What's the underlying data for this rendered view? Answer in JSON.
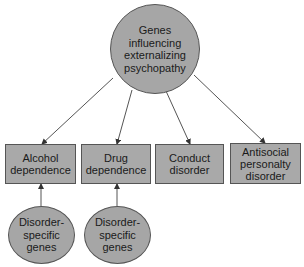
{
  "diagram": {
    "root": {
      "label": "Genes\ninfluencing\nexternalizing\npsychopathy",
      "fill": "#a6a6a6"
    },
    "disorders": [
      {
        "label": "Alcohol\ndependence"
      },
      {
        "label": "Drug\ndependence"
      },
      {
        "label": "Conduct\ndisorder"
      },
      {
        "label": "Antisocial\npersonalty\ndisorder"
      }
    ],
    "specific_genes": [
      {
        "label": "Disorder-\nspecific\ngenes",
        "target": "Alcohol dependence"
      },
      {
        "label": "Disorder-\nspecific\ngenes",
        "target": "Drug dependence"
      }
    ],
    "edges": [
      {
        "from": "Genes influencing externalizing psychopathy",
        "to": "Alcohol dependence"
      },
      {
        "from": "Genes influencing externalizing psychopathy",
        "to": "Drug dependence"
      },
      {
        "from": "Genes influencing externalizing psychopathy",
        "to": "Conduct disorder"
      },
      {
        "from": "Genes influencing externalizing psychopathy",
        "to": "Antisocial personalty disorder"
      },
      {
        "from": "Disorder-specific genes",
        "to": "Alcohol dependence"
      },
      {
        "from": "Disorder-specific genes",
        "to": "Drug dependence"
      }
    ],
    "colors": {
      "node_fill": "#a8a8a8",
      "stroke": "#555555"
    }
  }
}
